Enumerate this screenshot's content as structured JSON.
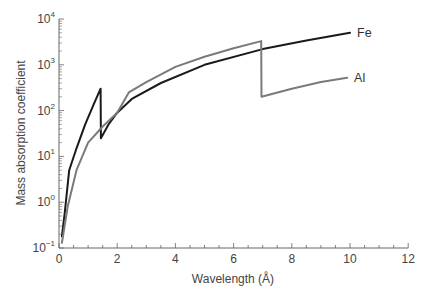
{
  "chart_data": {
    "type": "line",
    "title": "",
    "xlabel": "Wavelength (Å)",
    "ylabel": "Mass absorption coefficient",
    "xlim": [
      0,
      12
    ],
    "ylim": [
      0.1,
      10000
    ],
    "yscale": "log",
    "grid": false,
    "legend": "inline labels at curve ends",
    "x_ticks": [
      "0",
      "2",
      "4",
      "6",
      "8",
      "10",
      "12"
    ],
    "y_ticks": [
      {
        "base": "10",
        "exp": "4"
      },
      {
        "base": "10",
        "exp": "3"
      },
      {
        "base": "10",
        "exp": "2"
      },
      {
        "base": "10",
        "exp": "1"
      },
      {
        "base": "10",
        "exp": "0"
      },
      {
        "base": "10",
        "exp": "−1"
      }
    ],
    "series": [
      {
        "name": "Fe",
        "color": "#1a1a1a",
        "points": [
          [
            0.1,
            0.18
          ],
          [
            0.2,
            0.6
          ],
          [
            0.35,
            5
          ],
          [
            0.6,
            15
          ],
          [
            0.9,
            50
          ],
          [
            1.2,
            140
          ],
          [
            1.43,
            300
          ],
          [
            1.44,
            25
          ],
          [
            1.7,
            50
          ],
          [
            2.0,
            90
          ],
          [
            2.5,
            180
          ],
          [
            3.5,
            400
          ],
          [
            5,
            1000
          ],
          [
            7,
            2200
          ],
          [
            8.5,
            3400
          ],
          [
            10,
            5000
          ]
        ]
      },
      {
        "name": "Al",
        "color": "#7a7a7a",
        "points": [
          [
            0.1,
            0.13
          ],
          [
            0.3,
            0.8
          ],
          [
            0.6,
            5
          ],
          [
            1.0,
            20
          ],
          [
            1.5,
            45
          ],
          [
            2.0,
            90
          ],
          [
            2.4,
            250
          ],
          [
            3.0,
            420
          ],
          [
            4.0,
            900
          ],
          [
            5.0,
            1500
          ],
          [
            6.0,
            2300
          ],
          [
            6.95,
            3300
          ],
          [
            6.96,
            200
          ],
          [
            8.0,
            300
          ],
          [
            9.0,
            420
          ],
          [
            9.9,
            520
          ]
        ]
      }
    ]
  }
}
